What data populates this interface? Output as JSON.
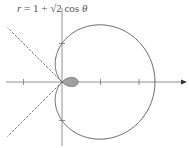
{
  "chart_data": {
    "type": "line",
    "subtype": "polar",
    "title": "r = 1 + √2 cos θ",
    "equation": {
      "r": "1 + sqrt(2) * cos(theta)",
      "a": 1,
      "b": 1.41421356
    },
    "theta_range": [
      0,
      6.2832
    ],
    "features": {
      "outer_loop_max_r": 2.414,
      "inner_loop_max_r": 0.414,
      "inner_loop_filled": true,
      "tangent_lines_at_pole_deg": [
        135,
        225
      ],
      "tangent_line_style": "dashed"
    },
    "x_ticks": [
      -1,
      1,
      2
    ],
    "y_ticks": [
      -1,
      1
    ],
    "xlim": [
      -1.6,
      3.2
    ],
    "ylim": [
      -1.6,
      1.6
    ],
    "grid": false,
    "x_axis_arrow": true,
    "colors": {
      "curve": "#666666",
      "fill": "#a0a0a0",
      "axis": "#777777",
      "dashed": "#555555"
    }
  },
  "label": {
    "prefix": "r",
    "text": " = 1 + √2 cos ",
    "theta": "θ"
  }
}
